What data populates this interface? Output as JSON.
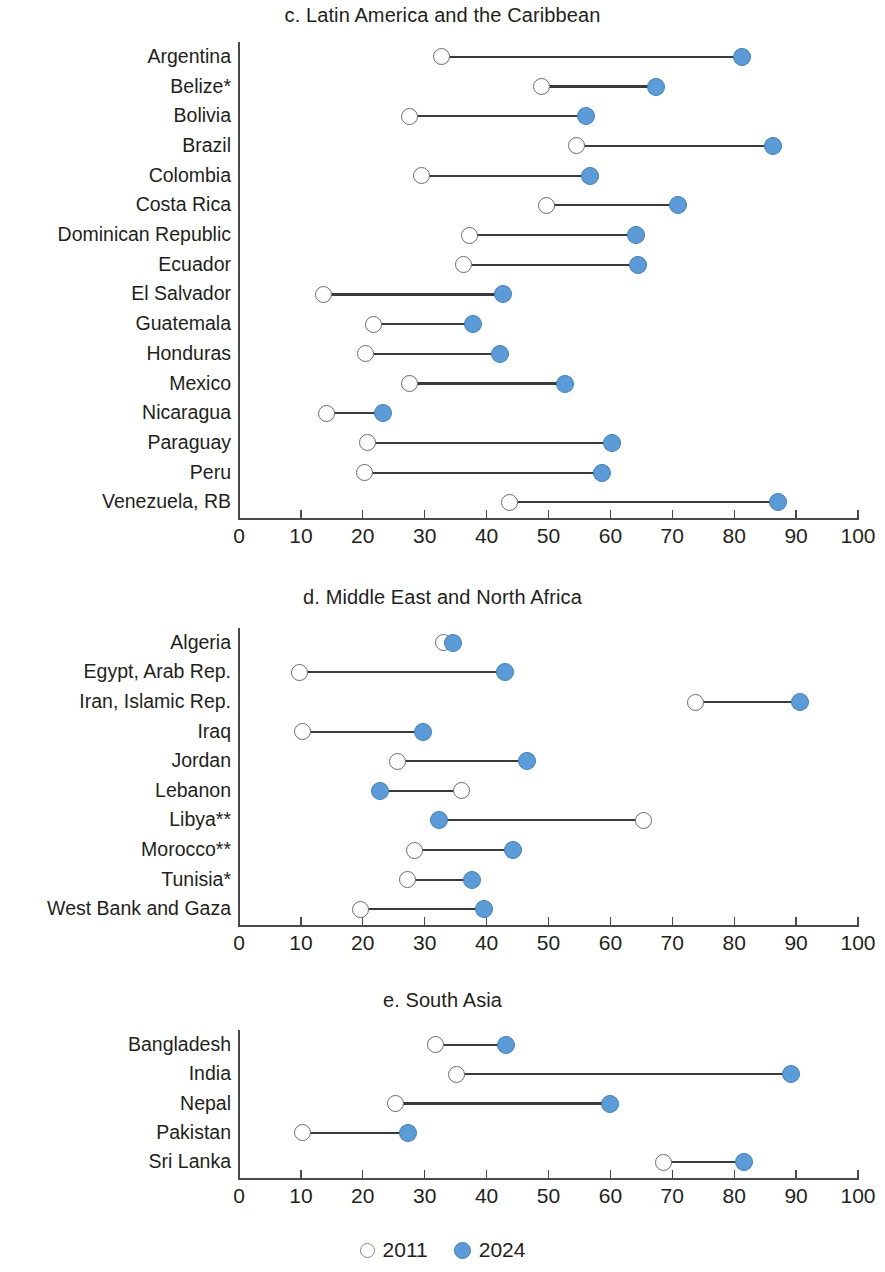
{
  "figure": {
    "legend": [
      {
        "id": "old",
        "label": "2011",
        "marker": "open-circle",
        "color": "#ffffff"
      },
      {
        "id": "new",
        "label": "2024",
        "marker": "filled-circle",
        "color": "#5b9bd8"
      }
    ],
    "axis": {
      "min": 0,
      "max": 100,
      "ticks": [
        0,
        10,
        20,
        30,
        40,
        50,
        60,
        70,
        80,
        90,
        100
      ],
      "tick_labels": [
        "0",
        "10",
        "20",
        "30",
        "40",
        "50",
        "60",
        "70",
        "80",
        "90",
        "100"
      ]
    }
  },
  "chart_data": [
    {
      "type": "dumbbell",
      "title": "c. Latin America and the Caribbean",
      "xlabel": "",
      "ylabel": "",
      "xlim": [
        0,
        100
      ],
      "grid": false,
      "legend_position": "bottom",
      "series": [
        {
          "name": "2011",
          "marker": "open-circle"
        },
        {
          "name": "2024",
          "marker": "filled-circle"
        }
      ],
      "categories": [
        "Argentina",
        "Belize*",
        "Bolivia",
        "Brazil",
        "Colombia",
        "Costa Rica",
        "Dominican Republic",
        "Ecuador",
        "El Salvador",
        "Guatemala",
        "Honduras",
        "Mexico",
        "Nicaragua",
        "Paraguay",
        "Peru",
        "Venezuela, RB"
      ],
      "values_2011": [
        32.7,
        48.8,
        27.6,
        54.5,
        29.5,
        49.7,
        37.3,
        36.3,
        13.6,
        21.8,
        20.4,
        27.5,
        14.1,
        20.7,
        20.2,
        43.7
      ],
      "values_2024": [
        81.3,
        67.4,
        56.1,
        86.3,
        56.7,
        70.9,
        64.1,
        64.4,
        42.6,
        37.8,
        42.1,
        52.6,
        23.3,
        60.3,
        58.6,
        87.0
      ]
    },
    {
      "type": "dumbbell",
      "title": "d. Middle East and North Africa",
      "xlabel": "",
      "ylabel": "",
      "xlim": [
        0,
        100
      ],
      "grid": false,
      "legend_position": "bottom",
      "series": [
        {
          "name": "2011",
          "marker": "open-circle"
        },
        {
          "name": "2024",
          "marker": "filled-circle"
        }
      ],
      "categories": [
        "Algeria",
        "Egypt, Arab Rep.",
        "Iran, Islamic Rep.",
        "Iraq",
        "Jordan",
        "Lebanon",
        "Libya**",
        "Morocco**",
        "Tunisia*",
        "West Bank and Gaza"
      ],
      "values_2011": [
        33.0,
        9.7,
        73.7,
        10.2,
        25.6,
        36.0,
        65.3,
        28.4,
        27.2,
        19.6
      ],
      "values_2024": [
        34.6,
        42.9,
        90.6,
        29.7,
        46.5,
        22.8,
        32.3,
        44.3,
        37.7,
        39.6
      ]
    },
    {
      "type": "dumbbell",
      "title": "e. South Asia",
      "xlabel": "",
      "ylabel": "",
      "xlim": [
        0,
        100
      ],
      "grid": false,
      "legend_position": "bottom",
      "series": [
        {
          "name": "2011",
          "marker": "open-circle"
        },
        {
          "name": "2024",
          "marker": "filled-circle"
        }
      ],
      "categories": [
        "Bangladesh",
        "India",
        "Nepal",
        "Pakistan",
        "Sri Lanka"
      ],
      "values_2011": [
        31.7,
        35.2,
        25.3,
        10.3,
        68.5
      ],
      "values_2024": [
        43.2,
        89.2,
        60.0,
        27.3,
        81.6
      ]
    }
  ]
}
